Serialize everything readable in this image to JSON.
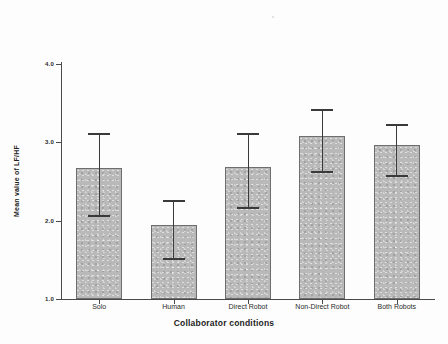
{
  "chart_data": {
    "type": "bar",
    "title": "",
    "xlabel": "Collaborator conditions",
    "ylabel": "Mean value of LF/HF",
    "categories": [
      "Solo",
      "Human",
      "Direct Robot",
      "Non-Direct Robot",
      "Both Robots"
    ],
    "values": [
      2.67,
      1.95,
      2.68,
      3.08,
      2.97
    ],
    "errors_upper": [
      3.12,
      2.26,
      3.12,
      3.43,
      3.24
    ],
    "errors_lower": [
      2.07,
      1.52,
      2.17,
      2.63,
      2.58
    ],
    "ylim": [
      1.0,
      4.0
    ],
    "yticks": [
      1.0,
      2.0,
      3.0,
      4.0
    ],
    "ytick_labels": [
      "1.0",
      "2.0",
      "3.0",
      "4.0"
    ],
    "grid": false,
    "legend": "none",
    "bar_color": "#b9b9b9",
    "bar_edge_color": "#6e6e6e",
    "error_bar_color": "#3a3a3a",
    "error_bar_type": "95% CI"
  },
  "axes": {
    "x_title": "Collaborator conditions",
    "y_title": "Mean value of LF/HF"
  },
  "ticks": {
    "y": [
      {
        "label": "4.0",
        "value": 4.0
      },
      {
        "label": "3.0",
        "value": 3.0
      },
      {
        "label": "2.0",
        "value": 2.0
      },
      {
        "label": "1.0",
        "value": 1.0
      }
    ]
  },
  "bars": [
    {
      "label": "Solo",
      "value": 2.67,
      "hi": 3.12,
      "lo": 2.07
    },
    {
      "label": "Human",
      "value": 1.95,
      "hi": 2.26,
      "lo": 1.52
    },
    {
      "label": "Direct Robot",
      "value": 2.68,
      "hi": 3.12,
      "lo": 2.17
    },
    {
      "label": "Non-Direct Robot",
      "value": 3.08,
      "hi": 3.43,
      "lo": 2.63
    },
    {
      "label": "Both Robots",
      "value": 2.97,
      "hi": 3.24,
      "lo": 2.58
    }
  ]
}
